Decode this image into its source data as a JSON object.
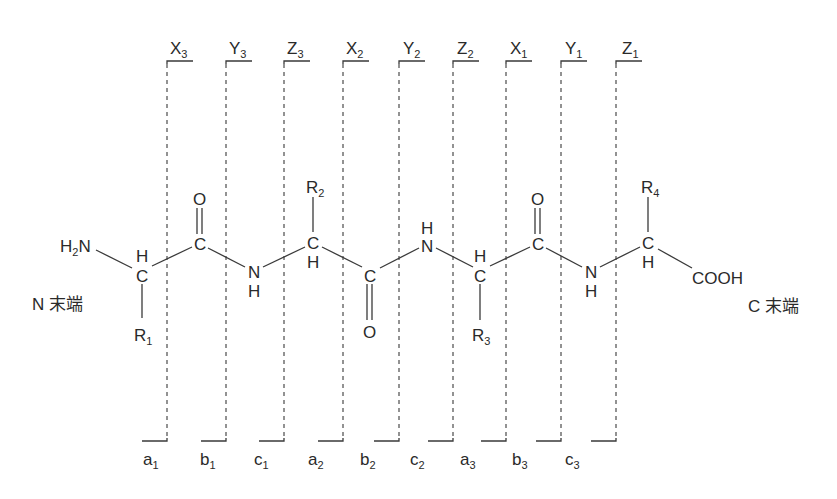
{
  "terminals": {
    "n_terminus": "N 末端",
    "c_terminus": "C 末端"
  },
  "top_ions": [
    {
      "letter": "X",
      "index": "3"
    },
    {
      "letter": "Y",
      "index": "3"
    },
    {
      "letter": "Z",
      "index": "3"
    },
    {
      "letter": "X",
      "index": "2"
    },
    {
      "letter": "Y",
      "index": "2"
    },
    {
      "letter": "Z",
      "index": "2"
    },
    {
      "letter": "X",
      "index": "1"
    },
    {
      "letter": "Y",
      "index": "1"
    },
    {
      "letter": "Z",
      "index": "1"
    }
  ],
  "bottom_ions": [
    {
      "letter": "a",
      "index": "1"
    },
    {
      "letter": "b",
      "index": "1"
    },
    {
      "letter": "c",
      "index": "1"
    },
    {
      "letter": "a",
      "index": "2"
    },
    {
      "letter": "b",
      "index": "2"
    },
    {
      "letter": "c",
      "index": "2"
    },
    {
      "letter": "a",
      "index": "3"
    },
    {
      "letter": "b",
      "index": "3"
    },
    {
      "letter": "c",
      "index": "3"
    }
  ],
  "atoms": {
    "h2n": {
      "main": "H",
      "sub": "2",
      "tail": "N"
    },
    "ca1": "C",
    "ca1_h": "H",
    "r1": {
      "main": "R",
      "sub": "1"
    },
    "c1": "C",
    "o1": "O",
    "n1": "N",
    "n1_h": "H",
    "ca2": "C",
    "ca2_h": "H",
    "r2": {
      "main": "R",
      "sub": "2"
    },
    "c2": "C",
    "o2": "O",
    "n2": "N",
    "n2_h": "H",
    "ca3": "C",
    "ca3_h": "H",
    "r3": {
      "main": "R",
      "sub": "3"
    },
    "c3": "C",
    "o3": "O",
    "n3": "N",
    "n3_h": "H",
    "ca4": "C",
    "ca4_h": "H",
    "r4": {
      "main": "R",
      "sub": "4"
    },
    "cooh": "COOH"
  }
}
